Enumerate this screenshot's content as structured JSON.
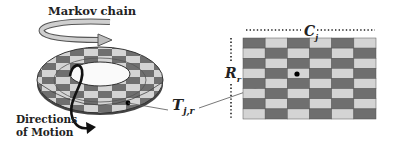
{
  "labels": {
    "markov_chain": "Markov chain",
    "directions_line1": "Directions",
    "directions_line2": "of Motion",
    "tile_symbol": "T",
    "tile_subscript": "j,r",
    "column_symbol": "C",
    "column_subscript": "j",
    "row_symbol": "R",
    "row_subscript": "r"
  },
  "grid": {
    "columns": 6,
    "rows": 8,
    "top_left_tone": "dark",
    "highlighted_cell": {
      "row": 4,
      "column": 3
    }
  },
  "colors": {
    "dark_tile": "#6f6f6f",
    "light_tile": "#d4d4d4",
    "tile_border": "#555555",
    "arrow": "#111111",
    "text": "#222222",
    "markov_arrow_fill": "#c8c8c8"
  }
}
